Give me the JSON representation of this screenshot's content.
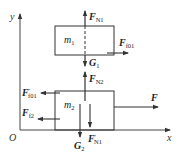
{
  "diagram": {
    "type": "free-body diagram",
    "axes": {
      "x_label": "x",
      "y_label": "y",
      "origin_label": "O"
    },
    "bodies": [
      {
        "name": "m",
        "sub": "1"
      },
      {
        "name": "m",
        "sub": "2"
      }
    ],
    "forces": {
      "fn1": {
        "main": "F",
        "sub": "N1",
        "prime": ""
      },
      "ff01": {
        "main": "F",
        "sub": "f01",
        "prime": ""
      },
      "g1": {
        "main": "G",
        "sub": "1",
        "prime": ""
      },
      "fn2": {
        "main": "F",
        "sub": "N2",
        "prime": ""
      },
      "ff01p": {
        "main": "F",
        "sub": "f01",
        "prime": "′"
      },
      "ff2": {
        "main": "F",
        "sub": "f2",
        "prime": ""
      },
      "f": {
        "main": "F",
        "sub": "",
        "prime": ""
      },
      "g2": {
        "main": "G",
        "sub": "2",
        "prime": ""
      },
      "fn1p": {
        "main": "F",
        "sub": "N1",
        "prime": "′"
      }
    },
    "colors": {
      "line": "#333333",
      "background": "#ffffff"
    }
  }
}
